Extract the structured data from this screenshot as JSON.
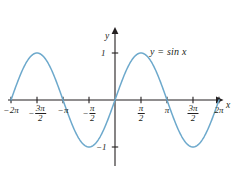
{
  "figure": {
    "kind": "function-graph",
    "background_color": "#ffffff",
    "curve_color": "#6da9cc",
    "axis_color": "#231f20",
    "text_color": "#231f20"
  },
  "axes": {
    "x_axis_label": "x",
    "y_axis_label": "y",
    "origin_label": "",
    "x_ticks": [
      {
        "id": "neg-2pi",
        "sign": "−",
        "body": "2π",
        "numerator": "",
        "denominator": "",
        "x_value": -6.2832
      },
      {
        "id": "neg-3pi-over-2",
        "sign": "−",
        "body": "",
        "numerator": "3π",
        "denominator": "2",
        "x_value": -4.7124
      },
      {
        "id": "neg-pi",
        "sign": "−",
        "body": "π",
        "numerator": "",
        "denominator": "",
        "x_value": -3.1416
      },
      {
        "id": "neg-pi-over-2",
        "sign": "−",
        "body": "",
        "numerator": "π",
        "denominator": "2",
        "x_value": -1.5708
      },
      {
        "id": "pi-over-2",
        "sign": "",
        "body": "",
        "numerator": "π",
        "denominator": "2",
        "x_value": 1.5708
      },
      {
        "id": "pi",
        "sign": "",
        "body": "π",
        "numerator": "",
        "denominator": "",
        "x_value": 3.1416
      },
      {
        "id": "3pi-over-2",
        "sign": "",
        "body": "",
        "numerator": "3π",
        "denominator": "2",
        "x_value": 4.7124
      },
      {
        "id": "2pi",
        "sign": "",
        "body": "2π",
        "numerator": "",
        "denominator": "",
        "x_value": 6.2832
      }
    ],
    "y_ticks": [
      {
        "id": "y-one",
        "label": "1",
        "y_value": 1
      },
      {
        "id": "y-neg-one",
        "label": "−1",
        "y_value": -1
      }
    ]
  },
  "annotations": {
    "equation": "y = sin x"
  },
  "chart_data": {
    "type": "line",
    "title": "",
    "subtitle": "",
    "xlabel": "x",
    "ylabel": "y",
    "xlim": [
      -6.9115,
      7.5398
    ],
    "ylim": [
      -1.55,
      1.55
    ],
    "grid": false,
    "legend": "none",
    "annotations": [
      "y = sin x"
    ],
    "xtick_values": [
      -6.2832,
      -4.7124,
      -3.1416,
      -1.5708,
      1.5708,
      3.1416,
      4.7124,
      6.2832
    ],
    "xtick_labels": [
      "−2π",
      "−3π/2",
      "−π",
      "−π/2",
      "π/2",
      "π",
      "3π/2",
      "2π"
    ],
    "ytick_values": [
      1,
      -1
    ],
    "ytick_labels": [
      "1",
      "−1"
    ],
    "series": [
      {
        "name": "y = sin x",
        "color": "#6da9cc",
        "formula": "sin(x)",
        "x": [
          -6.2832,
          -5.8905,
          -5.4978,
          -5.1051,
          -4.7124,
          -4.3197,
          -3.927,
          -3.5343,
          -3.1416,
          -2.7489,
          -2.3562,
          -1.9635,
          -1.5708,
          -1.1781,
          -0.7854,
          -0.3927,
          0.0,
          0.3927,
          0.7854,
          1.1781,
          1.5708,
          1.9635,
          2.3562,
          2.7489,
          3.1416,
          3.5343,
          3.927,
          4.3197,
          4.7124,
          5.1051,
          5.4978,
          5.8905,
          6.2832
        ],
        "y": [
          0.0,
          0.3827,
          0.7071,
          0.9239,
          1.0,
          0.9239,
          0.7071,
          0.3827,
          0.0,
          -0.3827,
          -0.7071,
          -0.9239,
          -1.0,
          -0.9239,
          -0.7071,
          -0.3827,
          0.0,
          0.3827,
          0.7071,
          0.9239,
          1.0,
          0.9239,
          0.7071,
          0.3827,
          0.0,
          -0.3827,
          -0.7071,
          -0.9239,
          -1.0,
          -0.9239,
          -0.7071,
          -0.3827,
          0.0
        ]
      }
    ]
  }
}
